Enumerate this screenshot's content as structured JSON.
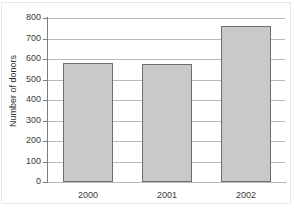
{
  "chart_data": {
    "type": "bar",
    "title": "",
    "xlabel": "",
    "ylabel": "Number of donors",
    "categories": [
      "2000",
      "2001",
      "2002"
    ],
    "values": [
      580,
      575,
      760
    ],
    "series": [
      {
        "name": "Number of donors",
        "values": [
          580,
          575,
          760
        ]
      }
    ],
    "ylim": [
      0,
      800
    ],
    "yticks": [
      0,
      100,
      200,
      300,
      400,
      500,
      600,
      700,
      800
    ],
    "ytick_labels": [
      "0",
      "100",
      "200",
      "300",
      "400",
      "500",
      "600",
      "700",
      "800"
    ],
    "grid": true,
    "grid_axis": "y",
    "legend": false,
    "legend_position": "none",
    "colors": {
      "bar_fill": "#c9c9c9",
      "bar_edge": "#6e6e6e",
      "gridline": "#b9b9b9",
      "axis": "#7d7d7d",
      "text": "#3a3a3a",
      "background": "#ffffff"
    }
  }
}
